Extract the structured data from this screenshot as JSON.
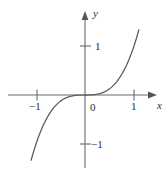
{
  "figure": {
    "name": "cubic-function-graph",
    "background_color": "#ffffff",
    "axis_color": "#6b6b6b",
    "curve_color": "#5a5a5a",
    "text_color": "#2b2b2b"
  },
  "axes": {
    "x_axis_label": "x",
    "y_axis_label": "y",
    "origin_label": "0"
  },
  "ticks": {
    "x": [
      {
        "value": -1,
        "label": "−1"
      },
      {
        "value": 1,
        "label": "1"
      }
    ],
    "y": [
      {
        "value": 1,
        "label": "1"
      },
      {
        "value": -1,
        "label": "−1"
      }
    ]
  },
  "chart_data": {
    "type": "line",
    "title": "",
    "xlabel": "x",
    "ylabel": "y",
    "grid": false,
    "legend": null,
    "xlim": [
      -1.12,
      1.47
    ],
    "ylim": [
      -1.58,
      1.6
    ],
    "xticks": [
      -1,
      1
    ],
    "xticklabels": [
      "−1",
      "1"
    ],
    "yticks": [
      -1,
      1
    ],
    "yticklabels": [
      "−1",
      "1"
    ],
    "series": [
      {
        "name": "y = x³",
        "equation": "y = x^3",
        "x": [
          -1.1,
          -1.05,
          -1.0,
          -0.95,
          -0.9,
          -0.85,
          -0.8,
          -0.75,
          -0.7,
          -0.65,
          -0.6,
          -0.55,
          -0.5,
          -0.45,
          -0.4,
          -0.35,
          -0.3,
          -0.25,
          -0.2,
          -0.15,
          -0.1,
          -0.05,
          0.0,
          0.05,
          0.1,
          0.15,
          0.2,
          0.25,
          0.3,
          0.35,
          0.4,
          0.45,
          0.5,
          0.55,
          0.6,
          0.65,
          0.7,
          0.75,
          0.8,
          0.85,
          0.9,
          0.95,
          1.0,
          1.05,
          1.1
        ],
        "y": [
          -1.331,
          -1.158,
          -1.0,
          -0.857,
          -0.729,
          -0.614,
          -0.512,
          -0.422,
          -0.343,
          -0.275,
          -0.216,
          -0.166,
          -0.125,
          -0.091,
          -0.064,
          -0.043,
          -0.027,
          -0.016,
          -0.008,
          -0.003,
          -0.001,
          0.0,
          0.0,
          0.0,
          0.001,
          0.003,
          0.008,
          0.016,
          0.027,
          0.043,
          0.064,
          0.091,
          0.125,
          0.166,
          0.216,
          0.275,
          0.343,
          0.422,
          0.512,
          0.614,
          0.729,
          0.857,
          1.0,
          1.158,
          1.331
        ]
      }
    ]
  }
}
